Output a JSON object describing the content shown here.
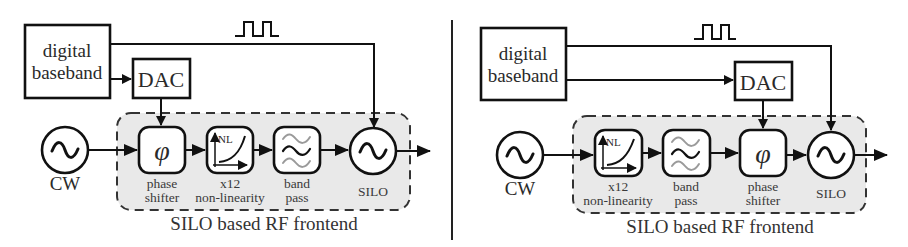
{
  "figure": {
    "panels": [
      {
        "id": "left",
        "description": "phase shifter before x12 non-linearity",
        "baseband": {
          "line1": "digital",
          "line2": "baseband"
        },
        "dac": "DAC",
        "source": "CW",
        "chain": [
          {
            "symbol": "φ",
            "label1": "phase",
            "label2": "shifter"
          },
          {
            "symbol": "NL",
            "label1": "x12",
            "label2": "non-linearity"
          },
          {
            "symbol": "bandpass",
            "label1": "band",
            "label2": "pass"
          },
          {
            "symbol": "sine",
            "label1": "SILO",
            "label2": ""
          }
        ],
        "frontend_caption": "SILO based RF frontend"
      },
      {
        "id": "right",
        "description": "phase shifter after band pass",
        "baseband": {
          "line1": "digital",
          "line2": "baseband"
        },
        "dac": "DAC",
        "source": "CW",
        "chain": [
          {
            "symbol": "NL",
            "label1": "x12",
            "label2": "non-linearity"
          },
          {
            "symbol": "bandpass",
            "label1": "band",
            "label2": "pass"
          },
          {
            "symbol": "φ",
            "label1": "phase",
            "label2": "shifter"
          },
          {
            "symbol": "sine",
            "label1": "SILO",
            "label2": ""
          }
        ],
        "frontend_caption": "SILO based RF frontend"
      }
    ],
    "colors": {
      "stroke": "#111111",
      "frontend_fill": "#e9e9e9",
      "passband_gray": "#9a9a9a"
    }
  }
}
